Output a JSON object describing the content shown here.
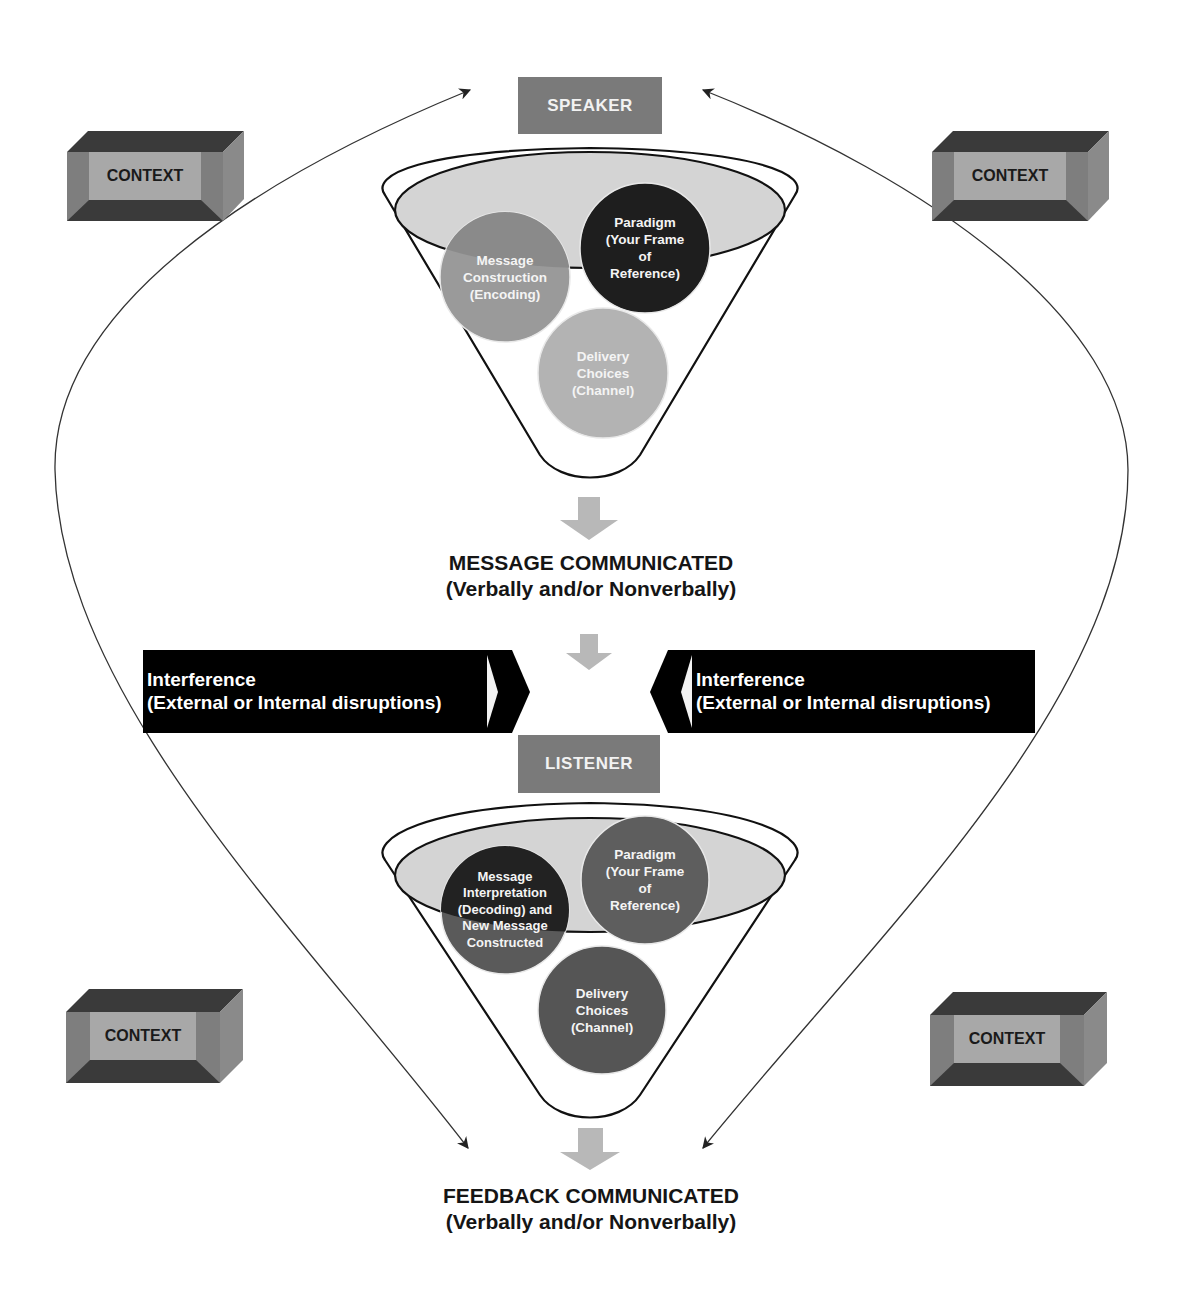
{
  "diagram": {
    "speaker": {
      "label": "SPEAKER"
    },
    "listener": {
      "label": "LISTENER"
    },
    "context_boxes": [
      {
        "position": "top-left",
        "label": "CONTEXT"
      },
      {
        "position": "top-right",
        "label": "CONTEXT"
      },
      {
        "position": "bottom-left",
        "label": "CONTEXT"
      },
      {
        "position": "bottom-right",
        "label": "CONTEXT"
      }
    ],
    "speaker_funnel": {
      "circles": [
        {
          "id": "message-construction",
          "label": "Message Construction (Encoding)",
          "lines": [
            "Message",
            "Construction",
            "(Encoding)"
          ],
          "color": "#9a9a9a"
        },
        {
          "id": "paradigm",
          "label": "Paradigm (Your Frame of Reference)",
          "lines": [
            "Paradigm",
            "(Your Frame",
            "of",
            "Reference)"
          ],
          "color": "#1e1e1e"
        },
        {
          "id": "delivery-choices",
          "label": "Delivery Choices (Channel)",
          "lines": [
            "Delivery",
            "Choices",
            "(Channel)"
          ],
          "color": "#b3b3b3"
        }
      ]
    },
    "listener_funnel": {
      "circles": [
        {
          "id": "message-interpretation",
          "label": "Message Interpretation (Decoding) and New Message Constructed",
          "lines": [
            "Message",
            "Interpretation",
            "(Decoding) and",
            "New Message",
            "Constructed"
          ],
          "color": "#2a2a2a"
        },
        {
          "id": "paradigm",
          "label": "Paradigm (Your Frame of Reference)",
          "lines": [
            "Paradigm",
            "(Your Frame",
            "of",
            "Reference)"
          ],
          "color": "#5e5e5e"
        },
        {
          "id": "delivery-choices",
          "label": "Delivery Choices (Channel)",
          "lines": [
            "Delivery",
            "Choices",
            "(Channel)"
          ],
          "color": "#5a5a5a"
        }
      ]
    },
    "message_communicated": {
      "title": "MESSAGE COMMUNICATED",
      "subtitle": "(Verbally and/or Nonverbally)"
    },
    "feedback_communicated": {
      "title": "FEEDBACK COMMUNICATED",
      "subtitle": "(Verbally and/or Nonverbally)"
    },
    "interference": [
      {
        "side": "left",
        "title": "Interference",
        "subtitle": "(External or Internal disruptions)"
      },
      {
        "side": "right",
        "title": "Interference",
        "subtitle": "(External or Internal disruptions)"
      }
    ],
    "colors": {
      "role_box": "#7a7a7a",
      "interference_bg": "#000000",
      "down_arrow": "#b8b8b8",
      "ellipse_fill": "#d4d4d4",
      "context_face": "#a8a8a8",
      "context_dark": "#3a3a3a",
      "context_side": "#7e7e7e"
    }
  }
}
